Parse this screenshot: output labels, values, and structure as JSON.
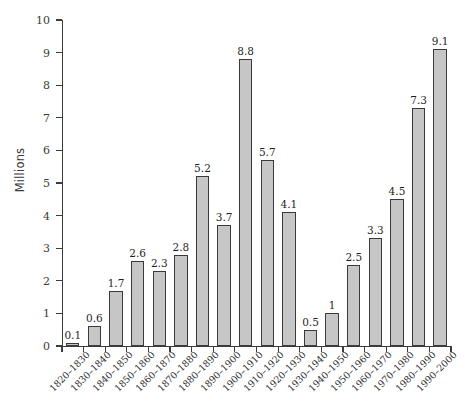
{
  "chart_data": {
    "type": "bar",
    "title": "",
    "subtitle": "",
    "xlabel": "",
    "ylabel": "Millions",
    "ylim": [
      0,
      10
    ],
    "ytick_labels": [
      "0",
      "1",
      "2",
      "3",
      "4",
      "5",
      "6",
      "7",
      "8",
      "9",
      "10"
    ],
    "yticks": [
      0,
      1,
      2,
      3,
      4,
      5,
      6,
      7,
      8,
      9,
      10
    ],
    "grid": false,
    "legend": null,
    "categories": [
      "1820–1830",
      "1830–1840",
      "1840–1850",
      "1850–1860",
      "1860–1870",
      "1870–1880",
      "1880–1890",
      "1890–1900",
      "1900–1910",
      "1910–1920",
      "1920–1930",
      "1930–1940",
      "1940–1950",
      "1950–1960",
      "1960–1970",
      "1970–1980",
      "1980–1990",
      "1990–2000"
    ],
    "values": [
      0.1,
      0.6,
      1.7,
      2.6,
      2.3,
      2.8,
      5.2,
      3.7,
      8.8,
      5.7,
      4.1,
      0.5,
      1,
      2.5,
      3.3,
      4.5,
      7.3,
      9.1
    ],
    "value_labels": [
      "0.1",
      "0.6",
      "1.7",
      "2.6",
      "2.3",
      "2.8",
      "5.2",
      "3.7",
      "8.8",
      "5.7",
      "4.1",
      "0.5",
      "1",
      "2.5",
      "3.3",
      "4.5",
      "7.3",
      "9.1"
    ],
    "colors": {
      "bar_fill": "#c6c6c6",
      "bar_border": "#3a3a3a",
      "axis": "#3c3c3c",
      "text": "#2b2b2b",
      "background": "#ffffff"
    }
  }
}
